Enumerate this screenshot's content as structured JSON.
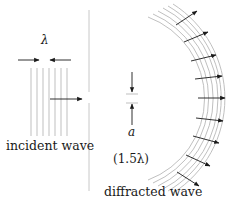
{
  "figure": {
    "labels": {
      "incident": "incident wave",
      "diffracted": "diffracted wave",
      "wavelength_symbol": "λ",
      "slit_symbol": "a",
      "slit_width": "(1.5λ)"
    },
    "colors": {
      "wavefront": "#b8b8b8",
      "barrier": "#c8c8c8",
      "arrow": "#1a1a1a",
      "text": "#1a1a1a"
    },
    "incident_wavefront_count": 7,
    "diffracted_wavefront_count": 6,
    "diffracted_arrow_count": 9
  }
}
